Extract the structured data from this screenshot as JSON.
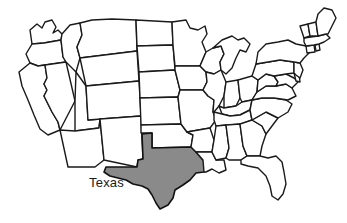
{
  "figure": {
    "name": "united-states-map",
    "width": 347,
    "height": 223,
    "background_color": "#ffffff",
    "outline_color": "#1a1a1a",
    "default_state_fill": "#ffffff",
    "highlight_fill": "#8a8a8a"
  },
  "labels": [
    {
      "id": "texas",
      "text": "Texas",
      "color": "#1a1a1a",
      "font_size": 13
    }
  ],
  "highlighted_states": [
    {
      "id": "TX",
      "name": "Texas",
      "fill": "#8a8a8a"
    }
  ],
  "map_data": {
    "type": "choropleth",
    "region": "contiguous-united-states",
    "projection": "simplified-outline",
    "states_shown": 48,
    "states": [
      {
        "id": "WA",
        "name": "Washington",
        "highlighted": false
      },
      {
        "id": "OR",
        "name": "Oregon",
        "highlighted": false
      },
      {
        "id": "CA",
        "name": "California",
        "highlighted": false
      },
      {
        "id": "ID",
        "name": "Idaho",
        "highlighted": false
      },
      {
        "id": "NV",
        "name": "Nevada",
        "highlighted": false
      },
      {
        "id": "UT",
        "name": "Utah",
        "highlighted": false
      },
      {
        "id": "AZ",
        "name": "Arizona",
        "highlighted": false
      },
      {
        "id": "MT",
        "name": "Montana",
        "highlighted": false
      },
      {
        "id": "WY",
        "name": "Wyoming",
        "highlighted": false
      },
      {
        "id": "CO",
        "name": "Colorado",
        "highlighted": false
      },
      {
        "id": "NM",
        "name": "New Mexico",
        "highlighted": false
      },
      {
        "id": "ND",
        "name": "North Dakota",
        "highlighted": false
      },
      {
        "id": "SD",
        "name": "South Dakota",
        "highlighted": false
      },
      {
        "id": "NE",
        "name": "Nebraska",
        "highlighted": false
      },
      {
        "id": "KS",
        "name": "Kansas",
        "highlighted": false
      },
      {
        "id": "OK",
        "name": "Oklahoma",
        "highlighted": false
      },
      {
        "id": "TX",
        "name": "Texas",
        "highlighted": true
      },
      {
        "id": "MN",
        "name": "Minnesota",
        "highlighted": false
      },
      {
        "id": "IA",
        "name": "Iowa",
        "highlighted": false
      },
      {
        "id": "MO",
        "name": "Missouri",
        "highlighted": false
      },
      {
        "id": "AR",
        "name": "Arkansas",
        "highlighted": false
      },
      {
        "id": "LA",
        "name": "Louisiana",
        "highlighted": false
      },
      {
        "id": "WI",
        "name": "Wisconsin",
        "highlighted": false
      },
      {
        "id": "IL",
        "name": "Illinois",
        "highlighted": false
      },
      {
        "id": "MS",
        "name": "Mississippi",
        "highlighted": false
      },
      {
        "id": "MI",
        "name": "Michigan",
        "highlighted": false
      },
      {
        "id": "IN",
        "name": "Indiana",
        "highlighted": false
      },
      {
        "id": "OH",
        "name": "Ohio",
        "highlighted": false
      },
      {
        "id": "KY",
        "name": "Kentucky",
        "highlighted": false
      },
      {
        "id": "TN",
        "name": "Tennessee",
        "highlighted": false
      },
      {
        "id": "AL",
        "name": "Alabama",
        "highlighted": false
      },
      {
        "id": "GA",
        "name": "Georgia",
        "highlighted": false
      },
      {
        "id": "FL",
        "name": "Florida",
        "highlighted": false
      },
      {
        "id": "SC",
        "name": "South Carolina",
        "highlighted": false
      },
      {
        "id": "NC",
        "name": "North Carolina",
        "highlighted": false
      },
      {
        "id": "VA",
        "name": "Virginia",
        "highlighted": false
      },
      {
        "id": "WV",
        "name": "West Virginia",
        "highlighted": false
      },
      {
        "id": "MD",
        "name": "Maryland",
        "highlighted": false
      },
      {
        "id": "DE",
        "name": "Delaware",
        "highlighted": false
      },
      {
        "id": "PA",
        "name": "Pennsylvania",
        "highlighted": false
      },
      {
        "id": "NJ",
        "name": "New Jersey",
        "highlighted": false
      },
      {
        "id": "NY",
        "name": "New York",
        "highlighted": false
      },
      {
        "id": "CT",
        "name": "Connecticut",
        "highlighted": false
      },
      {
        "id": "RI",
        "name": "Rhode Island",
        "highlighted": false
      },
      {
        "id": "MA",
        "name": "Massachusetts",
        "highlighted": false
      },
      {
        "id": "VT",
        "name": "Vermont",
        "highlighted": false
      },
      {
        "id": "NH",
        "name": "New Hampshire",
        "highlighted": false
      },
      {
        "id": "ME",
        "name": "Maine",
        "highlighted": false
      }
    ]
  }
}
